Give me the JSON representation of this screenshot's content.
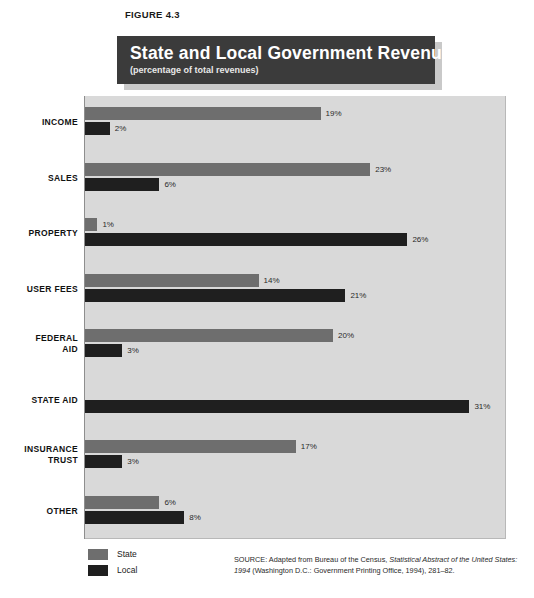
{
  "figure": {
    "label": "FIGURE 4.3"
  },
  "title": {
    "main": "State and Local Government Revenues",
    "subtitle": "(percentage of total revenues)"
  },
  "legend": {
    "items": [
      {
        "label": "State",
        "color": "#6e6e6e",
        "swatch": "state"
      },
      {
        "label": "Local",
        "color": "#1f1f1f",
        "swatch": "local"
      }
    ]
  },
  "source": {
    "prefix": "SOURCE:  Adapted from Bureau of the Census, ",
    "italic_title": "Statistical Abstract of the United States: 1994",
    "suffix": " (Washington D.C.: Government Printing Office, 1994), 281–82."
  },
  "colors": {
    "state_bar": "#6e6e6e",
    "local_bar": "#1f1f1f",
    "plot_background": "#d9d9d9",
    "banner": "#3b3b3b",
    "banner_shadow": "#c9c9c9",
    "page_background": "#ffffff"
  },
  "chart_data": {
    "type": "bar",
    "orientation": "horizontal",
    "title": "State and Local Government Revenues",
    "subtitle": "(percentage of total revenues)",
    "xlabel": "",
    "ylabel": "",
    "xlim": [
      0,
      34
    ],
    "grid": false,
    "legend_position": "bottom-left",
    "value_suffix": "%",
    "categories": [
      "INCOME",
      "SALES",
      "PROPERTY",
      "USER FEES",
      "FEDERAL AID",
      "STATE AID",
      "INSURANCE TRUST",
      "OTHER"
    ],
    "series": [
      {
        "name": "State",
        "color": "#6e6e6e",
        "values": [
          19,
          23,
          1,
          14,
          20,
          0,
          17,
          6
        ],
        "labels": [
          "19%",
          "23%",
          "1%",
          "14%",
          "20%",
          "",
          "17%",
          "6%"
        ]
      },
      {
        "name": "Local",
        "color": "#1f1f1f",
        "values": [
          2,
          6,
          26,
          21,
          3,
          31,
          3,
          8
        ],
        "labels": [
          "2%",
          "6%",
          "26%",
          "21%",
          "3%",
          "31%",
          "3%",
          "8%"
        ]
      }
    ]
  },
  "rows": [
    {
      "label": "INCOME",
      "label_lines": [
        "INCOME"
      ],
      "state": 19,
      "state_label": "19%",
      "local": 2,
      "local_label": "2%"
    },
    {
      "label": "SALES",
      "label_lines": [
        "SALES"
      ],
      "state": 23,
      "state_label": "23%",
      "local": 6,
      "local_label": "6%"
    },
    {
      "label": "PROPERTY",
      "label_lines": [
        "PROPERTY"
      ],
      "state": 1,
      "state_label": "1%",
      "local": 26,
      "local_label": "26%"
    },
    {
      "label": "USER FEES",
      "label_lines": [
        "USER FEES"
      ],
      "state": 14,
      "state_label": "14%",
      "local": 21,
      "local_label": "21%"
    },
    {
      "label": "FEDERAL AID",
      "label_lines": [
        "FEDERAL",
        "AID"
      ],
      "state": 20,
      "state_label": "20%",
      "local": 3,
      "local_label": "3%"
    },
    {
      "label": "STATE AID",
      "label_lines": [
        "STATE AID"
      ],
      "state": 0,
      "state_label": "",
      "local": 31,
      "local_label": "31%"
    },
    {
      "label": "INSURANCE TRUST",
      "label_lines": [
        "INSURANCE",
        "TRUST"
      ],
      "state": 17,
      "state_label": "17%",
      "local": 3,
      "local_label": "3%"
    },
    {
      "label": "OTHER",
      "label_lines": [
        "OTHER"
      ],
      "state": 6,
      "state_label": "6%",
      "local": 8,
      "local_label": "8%"
    }
  ]
}
